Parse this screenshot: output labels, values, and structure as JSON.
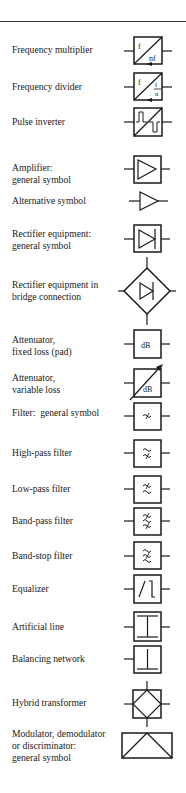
{
  "entries": [
    {
      "label": [
        "Frequency multiplier"
      ],
      "symbol": "frequency-multiplier",
      "box_text": [
        "f",
        "nf"
      ]
    },
    {
      "label": [
        "Frequency divider"
      ],
      "symbol": "frequency-divider",
      "box_text": [
        "f",
        "f",
        "n"
      ]
    },
    {
      "label": [
        "Pulse inverter"
      ],
      "symbol": "pulse-inverter"
    },
    {
      "label": [
        "Amplifier:",
        "general symbol"
      ],
      "symbol": "amplifier"
    },
    {
      "label": [
        "Alternative symbol"
      ],
      "symbol": "amplifier-alternative"
    },
    {
      "label": [
        "Rectifier equipment:",
        "general symbol"
      ],
      "symbol": "rectifier"
    },
    {
      "label": [
        "Rectifier equipment in",
        "bridge connection"
      ],
      "symbol": "rectifier-bridge"
    },
    {
      "label": [
        "Attenuator,",
        "fixed loss (pad)"
      ],
      "symbol": "attenuator-fixed",
      "box_text": [
        "dB"
      ]
    },
    {
      "label": [
        "Attenuator,",
        "variable loss"
      ],
      "symbol": "attenuator-variable",
      "box_text": [
        "dB"
      ]
    },
    {
      "label": [
        "Filter:  general symbol"
      ],
      "symbol": "filter"
    },
    {
      "label": [
        "High-pass filter"
      ],
      "symbol": "high-pass-filter"
    },
    {
      "label": [
        "Low-pass filter"
      ],
      "symbol": "low-pass-filter"
    },
    {
      "label": [
        "Band-pass filter"
      ],
      "symbol": "band-pass-filter"
    },
    {
      "label": [
        "Band-stop filter"
      ],
      "symbol": "band-stop-filter"
    },
    {
      "label": [
        "Equalizer"
      ],
      "symbol": "equalizer"
    },
    {
      "label": [
        "Artificial line"
      ],
      "symbol": "artificial-line"
    },
    {
      "label": [
        "Balancing network"
      ],
      "symbol": "balancing-network"
    },
    {
      "label": [
        "Hybrid transformer"
      ],
      "symbol": "hybrid-transformer"
    },
    {
      "label": [
        "Modulator, demodulator",
        "or discriminator:",
        "general symbol"
      ],
      "symbol": "modulator"
    }
  ],
  "colors": {
    "ink": "#1a1a1a",
    "paper": "#ffffff"
  }
}
